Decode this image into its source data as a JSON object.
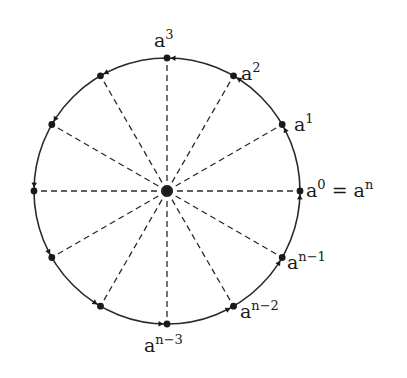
{
  "diagram": {
    "center": {
      "x": 167,
      "y": 191
    },
    "radius": 133,
    "point_count": 12,
    "colors": {
      "stroke": "#2a2a2a",
      "dot": "#1a1a1a",
      "background": "#ffffff"
    },
    "labels": [
      {
        "id": "a0",
        "base": "a",
        "exp": "0",
        "suffix": " = a",
        "suffix_exp": "n",
        "x": 306,
        "y": 197
      },
      {
        "id": "a1",
        "base": "a",
        "exp": "1",
        "x": 294,
        "y": 131
      },
      {
        "id": "a2",
        "base": "a",
        "exp": "2",
        "x": 241,
        "y": 80
      },
      {
        "id": "a3",
        "base": "a",
        "exp": "3",
        "x": 154,
        "y": 47
      },
      {
        "id": "an1",
        "base": "a",
        "exp": "n−1",
        "x": 287,
        "y": 269
      },
      {
        "id": "an2",
        "base": "a",
        "exp": "n−2",
        "x": 240,
        "y": 318
      },
      {
        "id": "an3",
        "base": "a",
        "exp": "n−3",
        "x": 144,
        "y": 352
      }
    ]
  }
}
